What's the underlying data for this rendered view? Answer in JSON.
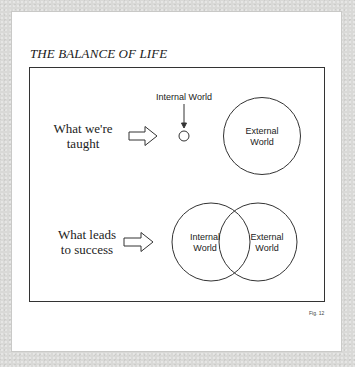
{
  "figure": {
    "title": "THE BALANCE OF LIFE",
    "caption": "Fig. 12",
    "rows": [
      {
        "left_label_line1": "What we're",
        "left_label_line2": "taught",
        "pointer_label": "Internal World",
        "small_circle_label": "",
        "large_circle_label_line1": "External",
        "large_circle_label_line2": "World"
      },
      {
        "left_label_line1": "What leads",
        "left_label_line2": "to success",
        "left_circle_label_line1": "Internal",
        "left_circle_label_line2": "World",
        "right_circle_label_line1": "External",
        "right_circle_label_line2": "World"
      }
    ]
  },
  "colors": {
    "background": "#d9d9d7",
    "card": "#ffffff",
    "ink": "#222222"
  }
}
